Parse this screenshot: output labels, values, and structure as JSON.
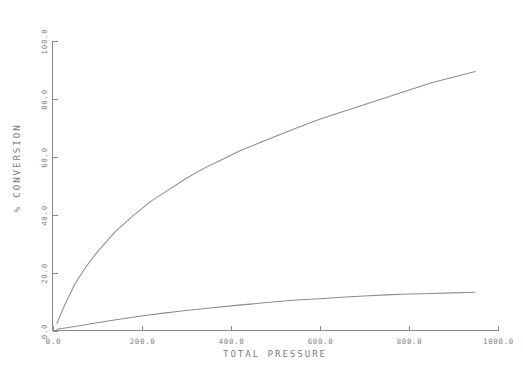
{
  "chart_data": {
    "type": "line",
    "title": "",
    "xlabel": "TOTAL PRESSURE",
    "ylabel": "% CONVERSION",
    "xlim": [
      0.0,
      1000.0
    ],
    "ylim": [
      0.0,
      100.0
    ],
    "grid": false,
    "legend": "none",
    "xticks": [
      0.0,
      200.0,
      400.0,
      600.0,
      800.0,
      1000.0
    ],
    "yticks": [
      0.0,
      20.0,
      40.0,
      60.0,
      80.0,
      100.0
    ],
    "xticklabels": [
      "0.0",
      "200.0",
      "400.0",
      "600.0",
      "800.0",
      "1000.0"
    ],
    "yticklabels": [
      "0.0",
      "20.0",
      "40.0",
      "60.0",
      "80.0",
      "100.0"
    ],
    "series": [
      {
        "name": "upper-curve",
        "color": "#8d8d8d",
        "x": [
          10,
          25,
          50,
          75,
          100,
          140,
          180,
          220,
          260,
          300,
          340,
          380,
          420,
          460,
          500,
          550,
          600,
          650,
          700,
          750,
          800,
          850,
          900,
          950
        ],
        "y": [
          2.5,
          8.0,
          16.0,
          22.0,
          27.0,
          34.0,
          39.5,
          44.5,
          48.5,
          52.5,
          56.0,
          59.0,
          62.0,
          64.5,
          67.0,
          70.0,
          73.0,
          75.5,
          78.0,
          80.5,
          83.0,
          85.5,
          87.5,
          89.5
        ]
      },
      {
        "name": "lower-curve",
        "color": "#8d8d8d",
        "x": [
          10,
          50,
          100,
          150,
          200,
          250,
          300,
          350,
          400,
          450,
          500,
          550,
          600,
          650,
          700,
          750,
          800,
          850,
          900,
          950
        ],
        "y": [
          0.4,
          1.4,
          2.7,
          3.9,
          5.0,
          6.0,
          6.9,
          7.7,
          8.5,
          9.2,
          9.9,
          10.5,
          11.0,
          11.5,
          11.9,
          12.3,
          12.6,
          12.8,
          13.0,
          13.2
        ]
      }
    ]
  },
  "axes": {
    "x_title": "TOTAL PRESSURE",
    "y_title": "% CONVERSION"
  }
}
